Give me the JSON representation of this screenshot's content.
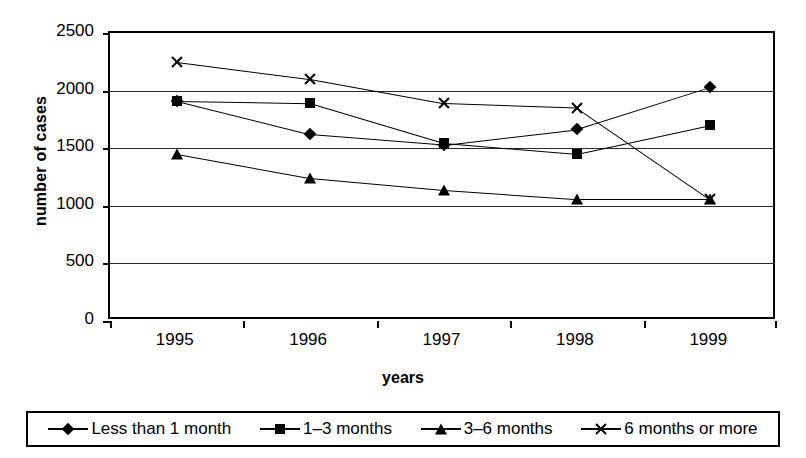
{
  "chart_data": {
    "type": "line",
    "title": "",
    "xlabel": "years",
    "ylabel": "number of cases",
    "categories": [
      "1995",
      "1996",
      "1997",
      "1998",
      "1999"
    ],
    "ylim": [
      0,
      2500
    ],
    "yticks": [
      0,
      500,
      1000,
      1500,
      2000,
      2500
    ],
    "ytick_labels": [
      "0",
      "500",
      "1000",
      "1500",
      "2000",
      "2500"
    ],
    "grid": true,
    "legend_position": "bottom",
    "series": [
      {
        "name": "Less than 1 month",
        "marker": "diamond",
        "color": "#000000",
        "values": [
          1910,
          1620,
          1530,
          1665,
          2030
        ]
      },
      {
        "name": "1–3 months",
        "marker": "square",
        "color": "#000000",
        "values": [
          1910,
          1890,
          1545,
          1450,
          1700
        ]
      },
      {
        "name": "3–6 months",
        "marker": "triangle",
        "color": "#000000",
        "values": [
          1450,
          1240,
          1135,
          1055,
          1055
        ]
      },
      {
        "name": "6 months or more",
        "marker": "x",
        "color": "#000000",
        "values": [
          2250,
          2100,
          1890,
          1850,
          1055
        ]
      }
    ]
  },
  "axes": {
    "y_title": "number of cases",
    "x_title": "years"
  }
}
